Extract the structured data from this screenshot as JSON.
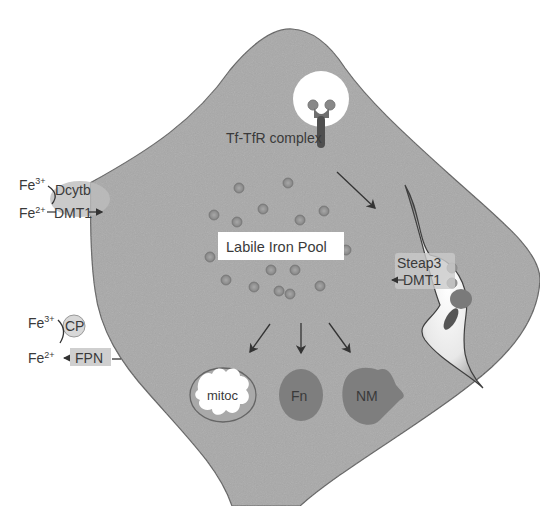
{
  "diagram": {
    "type": "cellular iron metabolism",
    "colors": {
      "cytoplasm": "#a9a9a9",
      "membrane": "#6b6b6b",
      "iron_dot": "#8e8e8e",
      "organelle_dark": "#7d7d7d",
      "text": "#3a3a3a",
      "label_box": "#ffffff"
    },
    "uptake": {
      "fe3": "Fe",
      "fe3_charge": "3+",
      "fe2": "Fe",
      "fe2_charge": "2+",
      "reductase": "Dcytb",
      "transporter": "DMT1"
    },
    "export": {
      "fe3": "Fe",
      "fe3_charge": "3+",
      "fe2": "Fe",
      "fe2_charge": "2+",
      "oxidase": "CP",
      "exporter": "FPN"
    },
    "tf_complex": {
      "label": "Tf-TfR complex"
    },
    "endosome": {
      "reductase": "Steap3",
      "transporter": "DMT1"
    },
    "pool": {
      "label": "Labile Iron Pool"
    },
    "destinations": [
      {
        "label": "mitoc"
      },
      {
        "label": "Fn"
      },
      {
        "label": "NM"
      }
    ]
  }
}
